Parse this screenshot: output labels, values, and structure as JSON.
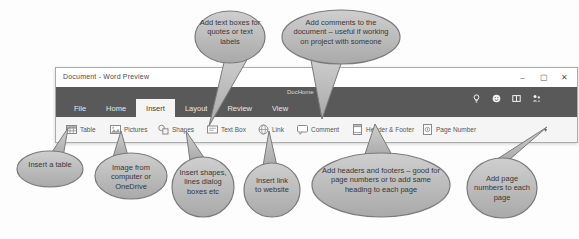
{
  "window": {
    "title": "Document - Word Preview",
    "controls": {
      "minimize": "–",
      "maximize": "▢",
      "close": "✕"
    },
    "account_name": "DocHome",
    "tabs": [
      {
        "label": "File"
      },
      {
        "label": "Home"
      },
      {
        "label": "Insert"
      },
      {
        "label": "Layout"
      },
      {
        "label": "Review"
      },
      {
        "label": "View"
      }
    ],
    "active_tab": "Insert",
    "title_bar_right_icons": [
      "lightbulb-icon",
      "smiley-icon",
      "book-icon",
      "share-people-icon"
    ],
    "ribbon": {
      "buttons": [
        {
          "label": "Table",
          "icon": "table-icon"
        },
        {
          "label": "Pictures",
          "icon": "pictures-icon"
        },
        {
          "label": "Shapes",
          "icon": "shapes-icon"
        },
        {
          "label": "Text Box",
          "icon": "text-box-icon"
        },
        {
          "label": "Link",
          "icon": "link-icon"
        },
        {
          "label": "Comment",
          "icon": "comment-icon"
        },
        {
          "label": "Header & Footer",
          "icon": "header-footer-icon"
        },
        {
          "label": "Page Number",
          "icon": "page-number-icon"
        }
      ],
      "overflow_chevron": "▾"
    }
  },
  "callouts": [
    {
      "id": "text-box",
      "text": "Add text boxes for quotes or text labels"
    },
    {
      "id": "comments",
      "text": "Add comments to the document – useful if working on project with someone"
    },
    {
      "id": "table",
      "text": "Insert a table"
    },
    {
      "id": "pictures",
      "text": "Image from computer or OneDrive"
    },
    {
      "id": "shapes",
      "text": "Insert shapes, lines dialog boxes etc"
    },
    {
      "id": "link",
      "text": "Insert link to website"
    },
    {
      "id": "header-footer",
      "text": "Add headers and footers – good for page numbers or to add same heading to each page"
    },
    {
      "id": "page-number",
      "text": "Add page numbers to each page"
    }
  ],
  "colors": {
    "ribbon_dark": "#595959",
    "ribbon_light": "#f5f5f5",
    "callout_fill_top": "#cfcfcf",
    "callout_fill_bottom": "#a9a9a9",
    "callout_border": "#7a7a7a"
  }
}
